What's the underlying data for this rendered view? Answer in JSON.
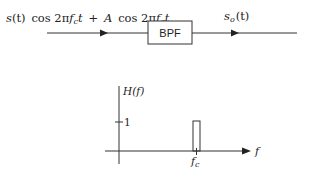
{
  "block_diagram": {
    "input_signal": {
      "s": "s",
      "t_paren": "(t)",
      "cos1": "cos 2π",
      "f1": "f",
      "sub1": "c",
      "t1": "t",
      "plus": "+",
      "A": "A",
      "cos2": "cos 2π",
      "f2": "f",
      "sub2": "c",
      "t2": "t"
    },
    "filter_label": "BPF",
    "output_signal": {
      "s": "s",
      "sub": "o",
      "t_paren": "(t)"
    }
  },
  "frequency_response": {
    "y_label": "H(f)",
    "x_label": "f",
    "tick_value": "1",
    "center_label": "f",
    "center_sub": "c"
  },
  "colors": {
    "stroke": "#333333",
    "text": "#222222",
    "background": "#ffffff"
  }
}
